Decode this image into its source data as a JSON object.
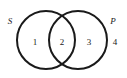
{
  "diagram": {
    "type": "venn-two-set",
    "background_color": "#ffffff",
    "stroke_color": "#1a1a1a",
    "stroke_width": 2,
    "width": 127,
    "height": 78,
    "sets": [
      {
        "id": "S",
        "label": "S",
        "position": "left",
        "center_x": 46,
        "center_y": 40,
        "radius": 29
      },
      {
        "id": "P",
        "label": "P",
        "position": "right",
        "center_x": 78,
        "center_y": 40,
        "radius": 29
      }
    ],
    "regions": [
      {
        "id": "region-1",
        "label": "1",
        "description": "S only"
      },
      {
        "id": "region-2",
        "label": "2",
        "description": "S and P intersection"
      },
      {
        "id": "region-3",
        "label": "3",
        "description": "P only"
      },
      {
        "id": "region-4",
        "label": "4",
        "description": "outside both sets"
      }
    ]
  }
}
